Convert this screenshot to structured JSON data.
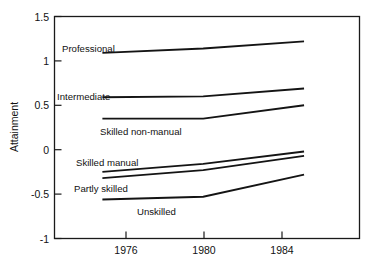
{
  "chart_data": {
    "type": "line",
    "title": "",
    "xlabel": "",
    "ylabel": "Attainment",
    "x": [
      1976,
      1980,
      1984
    ],
    "xtick_labels": [
      "1976",
      "1980",
      "1984"
    ],
    "ytick_labels": [
      "1.5",
      "1",
      "0.5",
      "0",
      "-0.5",
      "-1"
    ],
    "yticks": [
      1.5,
      1,
      0.5,
      0,
      -0.5,
      -1
    ],
    "ylim": [
      -1,
      1.5
    ],
    "xlim": [
      1974.1,
      1986.2
    ],
    "grid": false,
    "legend": "inline-labels",
    "line_color": "#141414",
    "frame_color": "#1a1a1a",
    "series": [
      {
        "name": "Professional",
        "label": "Professional",
        "values": [
          1.09,
          1.14,
          1.22
        ]
      },
      {
        "name": "Intermediate",
        "label": "Intermediate",
        "values": [
          0.59,
          0.6,
          0.69
        ]
      },
      {
        "name": "Skilled non-manual",
        "label": "Skilled non-manual",
        "values": [
          0.35,
          0.35,
          0.5
        ]
      },
      {
        "name": "Skilled manual",
        "label": "Skilled manual",
        "values": [
          -0.25,
          -0.16,
          -0.02
        ]
      },
      {
        "name": "Partly skilled",
        "label": "Partly skilled",
        "values": [
          -0.32,
          -0.23,
          -0.07
        ]
      },
      {
        "name": "Unskilled",
        "label": "Unskilled",
        "values": [
          -0.56,
          -0.53,
          -0.28
        ]
      }
    ],
    "series_label_positions": [
      {
        "name": "Professional",
        "x": 62,
        "y": 52,
        "anchor": "start"
      },
      {
        "name": "Intermediate",
        "x": 57,
        "y": 100,
        "anchor": "start"
      },
      {
        "name": "Skilled non-manual",
        "x": 100,
        "y": 135,
        "anchor": "start"
      },
      {
        "name": "Skilled manual",
        "x": 76,
        "y": 166,
        "anchor": "start"
      },
      {
        "name": "Partly skilled",
        "x": 74,
        "y": 192,
        "anchor": "start"
      },
      {
        "name": "Unskilled",
        "x": 137,
        "y": 215,
        "anchor": "start"
      }
    ]
  },
  "axis": {
    "y_title": "Attainment",
    "y_labels": [
      "1.5",
      "1",
      "0.5",
      "0",
      "-0.5",
      "-1"
    ],
    "x_labels": [
      "1976",
      "1980",
      "1984"
    ]
  }
}
